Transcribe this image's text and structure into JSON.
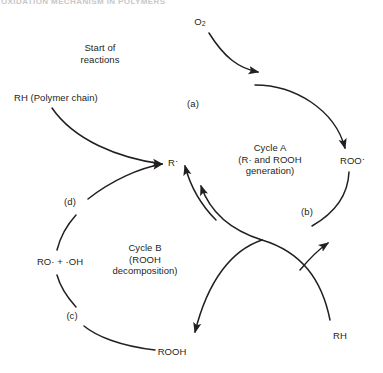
{
  "page": {
    "header_text": "OXIDATION MECHANISM IN POLYMERS"
  },
  "diagram": {
    "stroke_color": "#231f20",
    "background": "#ffffff",
    "labels": {
      "o2": "O",
      "o2_sub": "2",
      "start_of_reactions_line1": "Start of",
      "start_of_reactions_line2": "reactions",
      "rh_polymer": "RH (Polymer chain)",
      "r_radical": "R",
      "roo_radical": "ROO",
      "radical_dot": "·",
      "cycle_a_line1": "Cycle A",
      "cycle_a_line2": "(R· and ROOH",
      "cycle_a_line3": "generation)",
      "cycle_b_line1": "Cycle B",
      "cycle_b_line2": "(ROOH",
      "cycle_b_line3": "decomposition)",
      "ro_oh": "RO· + ·OH",
      "rooh": "ROOH",
      "rh": "RH",
      "step_a": "(a)",
      "step_b": "(b)",
      "step_c": "(c)",
      "step_d": "(d)"
    },
    "cycles": [
      {
        "name": "Cycle A",
        "center_x": 270,
        "center_y": 163,
        "radius": 80
      },
      {
        "name": "Cycle B",
        "center_x": 178,
        "center_y": 262,
        "radius": 62
      }
    ],
    "steps": [
      "(a)",
      "(b)",
      "(c)",
      "(d)"
    ],
    "species": [
      "O2",
      "RH (Polymer chain)",
      "R·",
      "ROO·",
      "ROOH",
      "RO· + ·OH",
      "RH"
    ]
  }
}
